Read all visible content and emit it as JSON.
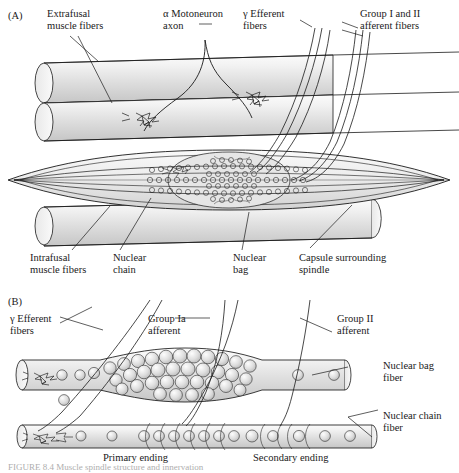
{
  "figure": {
    "type": "anatomical-diagram",
    "subject": "Muscle spindle structure",
    "caption": "FIGURE 8.4  Muscle spindle structure and innervation"
  },
  "panelA": {
    "tag": "(A)",
    "labels": {
      "extrafusal": "Extrafusal\nmuscle fibers",
      "alpha_motoneuron": "α Motoneuron\naxon",
      "gamma_efferent": "γ Efferent\nfibers",
      "group_i_ii": "Group I and II\nafferent fibers",
      "intrafusal": "Intrafusal\nmuscle fibers",
      "nuclear_chain": "Nuclear\nchain",
      "nuclear_bag": "Nuclear\nbag",
      "capsule": "Capsule surrounding\nspindle"
    }
  },
  "panelB": {
    "tag": "(B)",
    "labels": {
      "gamma_efferent": "γ Efferent\nfibers",
      "group_ia": "Group Ia\nafferent",
      "group_ii": "Group II\nafferent",
      "nuclear_bag_fiber": "Nuclear bag\nfiber",
      "nuclear_chain_fiber": "Nuclear chain\nfiber",
      "primary_ending": "Primary ending",
      "secondary_ending": "Secondary ending"
    }
  },
  "colors": {
    "ink": "#1a1a1a",
    "fiber_fill_light": "#f4f4f4",
    "fiber_fill_mid": "#d8d8d8",
    "fiber_fill_dark": "#c2c2c2",
    "nucleus_fill": "#d6d6d6",
    "background": "#ffffff"
  }
}
